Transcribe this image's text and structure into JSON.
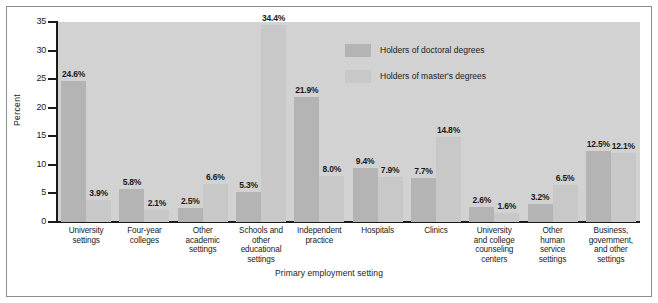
{
  "chart_data": {
    "type": "bar",
    "title": "",
    "xlabel": "Primary employment setting",
    "ylabel": "Percent",
    "ylim": [
      0,
      35
    ],
    "yticks": [
      "0",
      "5",
      "10",
      "15",
      "20",
      "25",
      "30",
      "35"
    ],
    "grid": false,
    "legend_position": "inside-top-right",
    "categories": [
      "University settings",
      "Four-year colleges",
      "Other academic settings",
      "Schools and other educational settings",
      "Independent practice",
      "Hospitals",
      "Clinics",
      "University and college counseling centers",
      "Other human service settings",
      "Business, government, and other settings"
    ],
    "category_lines": [
      [
        "University",
        "settings"
      ],
      [
        "Four-year",
        "colleges"
      ],
      [
        "Other",
        "academic",
        "settings"
      ],
      [
        "Schools and",
        "other",
        "educational",
        "settings"
      ],
      [
        "Independent",
        "practice"
      ],
      [
        "Hospitals"
      ],
      [
        "Clinics"
      ],
      [
        "University",
        "and college",
        "counseling",
        "centers"
      ],
      [
        "Other",
        "human",
        "service",
        "settings"
      ],
      [
        "Business,",
        "government,",
        "and other",
        "settings"
      ]
    ],
    "series": [
      {
        "name": "Holders of doctoral degrees",
        "color": "#b4b4b4",
        "values": [
          24.6,
          5.8,
          2.5,
          5.3,
          21.9,
          9.4,
          7.7,
          2.6,
          3.2,
          12.5
        ],
        "labels": [
          "24.6%",
          "5.8%",
          "2.5%",
          "5.3%",
          "21.9%",
          "9.4%",
          "7.7%",
          "2.6%",
          "3.2%",
          "12.5%"
        ]
      },
      {
        "name": "Holders of master's degrees",
        "color": "#c8c8c8",
        "values": [
          3.9,
          2.1,
          6.6,
          34.4,
          8.0,
          7.9,
          14.8,
          1.6,
          6.5,
          12.1
        ],
        "labels": [
          "3.9%",
          "2.1%",
          "6.6%",
          "34.4%",
          "8.0%",
          "7.9%",
          "14.8%",
          "1.6%",
          "6.5%",
          "12.1%"
        ]
      }
    ]
  },
  "axis": {
    "y_title": "Percent",
    "x_title": "Primary employment setting",
    "y_tick_labels": [
      "35",
      "30",
      "25",
      "20",
      "15",
      "10",
      "5",
      "0"
    ]
  },
  "legend": {
    "items": [
      {
        "label": "Holders of doctoral degrees",
        "color": "#b4b4b4"
      },
      {
        "label": "Holders of master's degrees",
        "color": "#c8c8c8"
      }
    ]
  },
  "colors": {
    "panel_background": "#d2d2d2",
    "figure_background": "#ffffff",
    "frame_border": "#8d8d8d",
    "axis": "#1a1a1a",
    "doctoral_bar": "#b4b4b4",
    "masters_bar": "#c8c8c8",
    "text": "#1a1a1a"
  }
}
